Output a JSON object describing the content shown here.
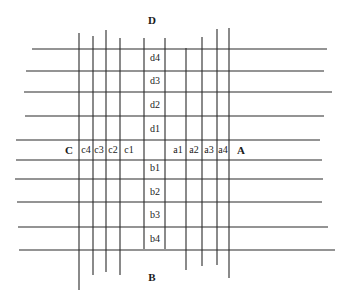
{
  "diagram": {
    "stroke_color": "#2a2a2a",
    "background": "#ffffff",
    "direction_labels": [
      {
        "id": "D",
        "text": "D",
        "x": 152,
        "y": 20
      },
      {
        "id": "B",
        "text": "B",
        "x": 152,
        "y": 277
      },
      {
        "id": "C",
        "text": "C",
        "x": 69,
        "y": 150
      },
      {
        "id": "A",
        "text": "A",
        "x": 241,
        "y": 150
      }
    ],
    "cell_labels": [
      {
        "id": "d4",
        "text": "d4",
        "x": 155,
        "y": 58
      },
      {
        "id": "d3",
        "text": "d3",
        "x": 155,
        "y": 81
      },
      {
        "id": "d2",
        "text": "d2",
        "x": 155,
        "y": 105
      },
      {
        "id": "d1",
        "text": "d1",
        "x": 155,
        "y": 129
      },
      {
        "id": "c4",
        "text": "c4",
        "x": 86,
        "y": 150
      },
      {
        "id": "c3",
        "text": "c3",
        "x": 99,
        "y": 150
      },
      {
        "id": "c2",
        "text": "c2",
        "x": 113,
        "y": 150
      },
      {
        "id": "c1",
        "text": "c1",
        "x": 129,
        "y": 150
      },
      {
        "id": "a1",
        "text": "a1",
        "x": 178,
        "y": 150
      },
      {
        "id": "a2",
        "text": "a2",
        "x": 194,
        "y": 150
      },
      {
        "id": "a3",
        "text": "a3",
        "x": 209,
        "y": 150
      },
      {
        "id": "a4",
        "text": "a4",
        "x": 223,
        "y": 150
      },
      {
        "id": "b1",
        "text": "b1",
        "x": 155,
        "y": 168
      },
      {
        "id": "b2",
        "text": "b2",
        "x": 155,
        "y": 192
      },
      {
        "id": "b3",
        "text": "b3",
        "x": 155,
        "y": 215
      },
      {
        "id": "b4",
        "text": "b4",
        "x": 155,
        "y": 239
      }
    ],
    "vertical_lines": [
      {
        "x": 79,
        "y1": 33,
        "y2": 290
      },
      {
        "x": 93,
        "y1": 36,
        "y2": 275
      },
      {
        "x": 106,
        "y1": 30,
        "y2": 272
      },
      {
        "x": 120,
        "y1": 38,
        "y2": 275
      },
      {
        "x": 144,
        "y1": 38,
        "y2": 249
      },
      {
        "x": 165,
        "y1": 38,
        "y2": 249
      },
      {
        "x": 186,
        "y1": 48,
        "y2": 270
      },
      {
        "x": 202,
        "y1": 37,
        "y2": 266
      },
      {
        "x": 217,
        "y1": 29,
        "y2": 265
      },
      {
        "x": 229,
        "y1": 28,
        "y2": 278
      }
    ],
    "horizontal_lines": [
      {
        "y": 49,
        "x1": 32,
        "x2": 327
      },
      {
        "y": 71,
        "x1": 26,
        "x2": 324
      },
      {
        "y": 92,
        "x1": 24,
        "x2": 332
      },
      {
        "y": 116,
        "x1": 25,
        "x2": 324
      },
      {
        "y": 140,
        "x1": 16,
        "x2": 320
      },
      {
        "y": 160,
        "x1": 16,
        "x2": 322
      },
      {
        "y": 179,
        "x1": 15,
        "x2": 323
      },
      {
        "y": 202,
        "x1": 17,
        "x2": 322
      },
      {
        "y": 227,
        "x1": 18,
        "x2": 328
      },
      {
        "y": 250,
        "x1": 19,
        "x2": 335
      }
    ]
  }
}
